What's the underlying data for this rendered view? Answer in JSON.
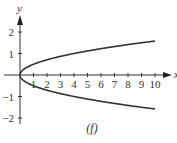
{
  "chart_data": {
    "type": "line",
    "title": "",
    "caption": "(f)",
    "xlabel": "x",
    "ylabel": "y",
    "xlim": [
      0,
      10
    ],
    "ylim": [
      -2,
      2
    ],
    "x_ticks": [
      "1",
      "2",
      "3",
      "4",
      "5",
      "6",
      "7",
      "8",
      "9",
      "10"
    ],
    "y_ticks": [
      "2",
      "1",
      "−1",
      "−2"
    ],
    "grid": false,
    "legend": null,
    "series": [
      {
        "name": "upper branch",
        "x": [
          0,
          0.25,
          1,
          2,
          3,
          4,
          5,
          6,
          7,
          8,
          9,
          10
        ],
        "values": [
          0,
          0.25,
          0.5,
          0.71,
          0.87,
          1.0,
          1.12,
          1.22,
          1.32,
          1.41,
          1.5,
          1.58
        ]
      },
      {
        "name": "lower branch",
        "x": [
          0,
          0.25,
          1,
          2,
          3,
          4,
          5,
          6,
          7,
          8,
          9,
          10
        ],
        "values": [
          0,
          -0.25,
          -0.5,
          -0.71,
          -0.87,
          -1.0,
          -1.12,
          -1.22,
          -1.32,
          -1.41,
          -1.5,
          -1.58
        ]
      }
    ],
    "color": "#333333"
  }
}
